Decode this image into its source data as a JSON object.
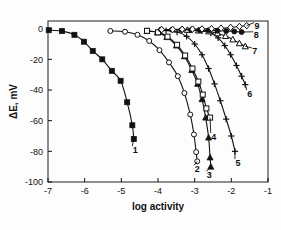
{
  "chart_data": {
    "type": "line",
    "title": "",
    "xlabel": "log activity",
    "ylabel": "ΔE, mV",
    "xlim": [
      -7,
      -1
    ],
    "ylim": [
      -100,
      5
    ],
    "xticks": [
      -7,
      -6,
      -5,
      -4,
      -3,
      -2,
      -1
    ],
    "xtick_labels": [
      "-7",
      "-6",
      "-5",
      "-4",
      "-3",
      "-2",
      "-1"
    ],
    "yticks": [
      0,
      -20,
      -40,
      -60,
      -80,
      -100
    ],
    "ytick_labels": [
      "0",
      "-20",
      "-40",
      "-60",
      "-80",
      "-100"
    ],
    "grid": false,
    "legend": "curve-end-labels",
    "frame": "box",
    "series": [
      {
        "name": "1",
        "label": "1",
        "marker": "filled-square",
        "label_x": -4.62,
        "label_y": -78.5,
        "points": [
          {
            "x": -6.98,
            "y": -1.0
          },
          {
            "x": -6.62,
            "y": -1.6
          },
          {
            "x": -6.28,
            "y": -4.0
          },
          {
            "x": -6.02,
            "y": -8.5
          },
          {
            "x": -5.78,
            "y": -14.5
          },
          {
            "x": -5.52,
            "y": -20.0
          },
          {
            "x": -5.26,
            "y": -27.5
          },
          {
            "x": -5.02,
            "y": -34.0
          },
          {
            "x": -4.84,
            "y": -48.0
          },
          {
            "x": -4.7,
            "y": -63.0
          },
          {
            "x": -4.66,
            "y": -72.0
          }
        ]
      },
      {
        "name": "2",
        "label": "2",
        "marker": "open-circle",
        "label_x": -2.93,
        "label_y": -91.0,
        "points": [
          {
            "x": -5.3,
            "y": -1.5
          },
          {
            "x": -4.9,
            "y": -2.0
          },
          {
            "x": -4.56,
            "y": -4.0
          },
          {
            "x": -4.24,
            "y": -8.0
          },
          {
            "x": -3.96,
            "y": -14.0
          },
          {
            "x": -3.7,
            "y": -22.0
          },
          {
            "x": -3.46,
            "y": -31.0
          },
          {
            "x": -3.28,
            "y": -42.0
          },
          {
            "x": -3.12,
            "y": -56.0
          },
          {
            "x": -3.02,
            "y": -69.0
          },
          {
            "x": -2.96,
            "y": -80.5
          },
          {
            "x": -2.93,
            "y": -86.5
          }
        ]
      },
      {
        "name": "3",
        "label": "3",
        "marker": "filled-triangle",
        "label_x": -2.6,
        "label_y": -95.0,
        "points": [
          {
            "x": -4.3,
            "y": -1.5
          },
          {
            "x": -4.02,
            "y": -2.5
          },
          {
            "x": -3.76,
            "y": -5.5
          },
          {
            "x": -3.5,
            "y": -11.0
          },
          {
            "x": -3.28,
            "y": -18.0
          },
          {
            "x": -3.08,
            "y": -27.0
          },
          {
            "x": -2.92,
            "y": -36.0
          },
          {
            "x": -2.8,
            "y": -46.0
          },
          {
            "x": -2.7,
            "y": -58.0
          },
          {
            "x": -2.62,
            "y": -71.0
          },
          {
            "x": -2.58,
            "y": -84.0
          },
          {
            "x": -2.56,
            "y": -90.0
          }
        ]
      },
      {
        "name": "4",
        "label": "4",
        "marker": "open-square",
        "label_x": -2.48,
        "label_y": -70.0,
        "points": [
          {
            "x": -4.3,
            "y": -1.4
          },
          {
            "x": -4.0,
            "y": -2.4
          },
          {
            "x": -3.74,
            "y": -5.2
          },
          {
            "x": -3.48,
            "y": -10.5
          },
          {
            "x": -3.26,
            "y": -17.5
          },
          {
            "x": -3.06,
            "y": -26.0
          },
          {
            "x": -2.9,
            "y": -34.5
          },
          {
            "x": -2.78,
            "y": -43.0
          },
          {
            "x": -2.68,
            "y": -52.0
          },
          {
            "x": -2.58,
            "y": -58.0
          }
        ]
      },
      {
        "name": "5",
        "label": "5",
        "marker": "plus",
        "label_x": -1.82,
        "label_y": -87.0,
        "points": [
          {
            "x": -3.78,
            "y": -1.2
          },
          {
            "x": -3.48,
            "y": -2.2
          },
          {
            "x": -3.22,
            "y": -5.0
          },
          {
            "x": -3.0,
            "y": -10.0
          },
          {
            "x": -2.8,
            "y": -17.0
          },
          {
            "x": -2.62,
            "y": -26.0
          },
          {
            "x": -2.46,
            "y": -36.0
          },
          {
            "x": -2.3,
            "y": -47.0
          },
          {
            "x": -2.14,
            "y": -59.0
          },
          {
            "x": -2.0,
            "y": -70.0
          },
          {
            "x": -1.9,
            "y": -80.0
          }
        ]
      },
      {
        "name": "6",
        "label": "6",
        "marker": "plus",
        "label_x": -1.5,
        "label_y": -42.0,
        "points": [
          {
            "x": -3.1,
            "y": -0.8
          },
          {
            "x": -2.8,
            "y": -1.4
          },
          {
            "x": -2.56,
            "y": -3.0
          },
          {
            "x": -2.36,
            "y": -6.0
          },
          {
            "x": -2.18,
            "y": -11.0
          },
          {
            "x": -2.02,
            "y": -17.0
          },
          {
            "x": -1.86,
            "y": -24.0
          },
          {
            "x": -1.72,
            "y": -31.0
          },
          {
            "x": -1.62,
            "y": -36.5
          }
        ]
      },
      {
        "name": "7",
        "label": "7",
        "marker": "open-triangle",
        "label_x": -1.36,
        "label_y": -14.5,
        "points": [
          {
            "x": -3.2,
            "y": -0.8
          },
          {
            "x": -2.9,
            "y": -1.2
          },
          {
            "x": -2.62,
            "y": -1.8
          },
          {
            "x": -2.38,
            "y": -3.0
          },
          {
            "x": -2.16,
            "y": -4.8
          },
          {
            "x": -1.96,
            "y": -7.0
          },
          {
            "x": -1.78,
            "y": -9.5
          },
          {
            "x": -1.62,
            "y": -11.5
          }
        ]
      },
      {
        "name": "8",
        "label": "8",
        "marker": "filled-circle",
        "label_x": -1.32,
        "label_y": -4.0,
        "points": [
          {
            "x": -3.92,
            "y": -0.6
          },
          {
            "x": -3.62,
            "y": -0.7
          },
          {
            "x": -3.36,
            "y": -0.8
          },
          {
            "x": -3.1,
            "y": -0.9
          },
          {
            "x": -2.86,
            "y": -1.0
          },
          {
            "x": -2.62,
            "y": -1.1
          },
          {
            "x": -2.38,
            "y": -1.3
          },
          {
            "x": -2.14,
            "y": -1.5
          },
          {
            "x": -1.92,
            "y": -1.8
          },
          {
            "x": -1.72,
            "y": -2.2
          }
        ]
      },
      {
        "name": "9",
        "label": "9",
        "marker": "open-diamond",
        "label_x": -1.3,
        "label_y": 2.0,
        "points": [
          {
            "x": -3.9,
            "y": -0.6
          },
          {
            "x": -3.6,
            "y": -0.5
          },
          {
            "x": -3.34,
            "y": -0.4
          },
          {
            "x": -3.06,
            "y": -0.3
          },
          {
            "x": -2.8,
            "y": -0.2
          },
          {
            "x": -2.54,
            "y": 0.0
          },
          {
            "x": -2.28,
            "y": 0.3
          },
          {
            "x": -2.02,
            "y": 0.8
          },
          {
            "x": -1.78,
            "y": 1.4
          },
          {
            "x": -1.58,
            "y": 2.0
          }
        ]
      }
    ]
  },
  "style": {
    "line_color": "#111111",
    "marker_fill_open": "#ffffff",
    "marker_fill_solid": "#111111",
    "frame_color": "#333333",
    "background": "#ffffff"
  }
}
